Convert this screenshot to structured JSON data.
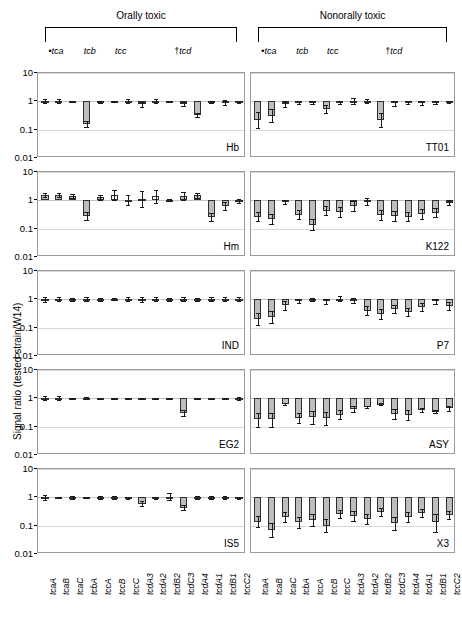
{
  "groups": {
    "left": {
      "title": "Orally toxic"
    },
    "right": {
      "title": "Nonorally toxic"
    }
  },
  "subheads": [
    {
      "marker": "•",
      "label": "tca"
    },
    {
      "marker": "",
      "label": "tcb"
    },
    {
      "marker": "",
      "label": "tcc"
    },
    {
      "marker": "†",
      "label": "tcd"
    }
  ],
  "axis": {
    "ylabel": "Signal ratio (tested strain/W14)",
    "yticks": [
      "10",
      "1",
      "0.1",
      "0.01"
    ],
    "ymin": 0.01,
    "ymax": 10,
    "baseline": 1
  },
  "genes": [
    "tcaA",
    "tcaB",
    "tcaC",
    "tcbA",
    "tccA",
    "tccB",
    "tccC",
    "tcdA3",
    "tcdA2",
    "tcdB2",
    "tcdC3",
    "tcdA4",
    "tcdA1",
    "tcdB1",
    "tccC2"
  ],
  "chart_data": {
    "type": "bar",
    "xlabel": "",
    "ylabel": "Signal ratio (tested strain/W14)",
    "yscale": "log",
    "ylim": [
      0.01,
      10
    ],
    "grid": true,
    "baseline": 1,
    "categories": [
      "tcaA",
      "tcaB",
      "tcaC",
      "tcbA",
      "tccA",
      "tccB",
      "tccC",
      "tcdA3",
      "tcdA2",
      "tcdB2",
      "tcdC3",
      "tcdA4",
      "tcdA1",
      "tcdB1",
      "tccC2"
    ],
    "column_groups": [
      "Orally toxic",
      "Nonorally toxic"
    ],
    "panels": [
      {
        "name": "Hb",
        "column": "left",
        "row": 0,
        "values": [
          1.05,
          1.02,
          0.98,
          0.16,
          0.95,
          0.99,
          1.0,
          0.78,
          1.03,
          0.98,
          0.8,
          0.33,
          0.95,
          0.92,
          0.97
        ],
        "err_low": [
          0.88,
          0.86,
          0.96,
          0.12,
          0.88,
          0.94,
          0.84,
          0.62,
          0.86,
          0.92,
          0.66,
          0.27,
          0.88,
          0.76,
          0.9
        ],
        "err_high": [
          1.25,
          1.2,
          1.0,
          0.21,
          1.02,
          1.04,
          1.18,
          0.95,
          1.22,
          1.04,
          0.96,
          0.4,
          1.02,
          1.1,
          1.04
        ],
        "open": [
          false,
          false,
          false,
          false,
          false,
          false,
          false,
          true,
          false,
          false,
          true,
          false,
          false,
          true,
          false
        ]
      },
      {
        "name": "Hm",
        "column": "left",
        "row": 1,
        "values": [
          1.55,
          1.5,
          1.45,
          0.28,
          1.3,
          1.6,
          1.05,
          1.15,
          1.4,
          1.02,
          1.45,
          1.5,
          0.25,
          0.62,
          0.95
        ],
        "err_low": [
          1.35,
          1.3,
          1.25,
          0.2,
          1.05,
          1.0,
          0.7,
          0.6,
          0.8,
          0.95,
          1.0,
          1.2,
          0.18,
          0.45,
          0.82
        ],
        "err_high": [
          1.8,
          1.75,
          1.65,
          0.4,
          1.6,
          2.4,
          1.5,
          2.1,
          2.3,
          1.1,
          2.0,
          1.85,
          0.35,
          0.86,
          1.1
        ],
        "open": [
          false,
          false,
          false,
          false,
          false,
          true,
          false,
          true,
          true,
          false,
          false,
          false,
          false,
          false,
          false
        ]
      },
      {
        "name": "IND",
        "column": "left",
        "row": 2,
        "values": [
          0.98,
          1.0,
          0.97,
          1.02,
          0.99,
          1.0,
          1.01,
          0.98,
          1.02,
          0.99,
          1.0,
          1.01,
          1.0,
          1.02,
          0.99
        ],
        "err_low": [
          0.8,
          0.84,
          0.86,
          0.88,
          0.9,
          0.92,
          0.86,
          0.8,
          0.88,
          0.86,
          0.84,
          0.9,
          0.86,
          0.88,
          0.86
        ],
        "err_high": [
          1.2,
          1.22,
          1.14,
          1.18,
          1.1,
          1.1,
          1.2,
          1.25,
          1.2,
          1.16,
          1.22,
          1.14,
          1.18,
          1.2,
          1.18
        ],
        "open": [
          false,
          false,
          false,
          false,
          false,
          false,
          false,
          false,
          true,
          false,
          true,
          true,
          false,
          true,
          false
        ]
      },
      {
        "name": "EG2",
        "column": "left",
        "row": 3,
        "values": [
          1.0,
          1.0,
          1.02,
          1.05,
          1.01,
          1.0,
          0.96,
          1.0,
          1.01,
          1.02,
          0.3,
          1.01,
          1.0,
          1.02,
          0.99
        ],
        "err_low": [
          0.84,
          0.84,
          0.98,
          0.96,
          0.98,
          0.96,
          0.92,
          0.96,
          0.98,
          0.98,
          0.24,
          0.98,
          0.96,
          0.98,
          0.88
        ],
        "err_high": [
          1.2,
          1.2,
          1.06,
          1.12,
          1.04,
          1.04,
          1.0,
          1.04,
          1.04,
          1.06,
          0.38,
          1.04,
          1.04,
          1.06,
          1.12
        ],
        "open": [
          false,
          false,
          false,
          false,
          false,
          false,
          false,
          false,
          false,
          false,
          false,
          false,
          false,
          false,
          false
        ]
      },
      {
        "name": "IS5",
        "column": "left",
        "row": 4,
        "values": [
          0.98,
          1.0,
          0.97,
          1.0,
          0.96,
          0.98,
          0.92,
          0.6,
          0.95,
          1.05,
          0.42,
          0.98,
          1.0,
          0.97,
          0.95
        ],
        "err_low": [
          0.8,
          0.96,
          0.86,
          0.96,
          0.86,
          0.88,
          0.84,
          0.48,
          0.86,
          0.78,
          0.35,
          0.88,
          0.88,
          0.88,
          0.86
        ],
        "err_high": [
          1.22,
          1.04,
          1.12,
          1.04,
          1.1,
          1.1,
          1.02,
          0.74,
          1.06,
          1.45,
          0.52,
          1.1,
          1.14,
          1.08,
          1.06
        ],
        "open": [
          false,
          false,
          false,
          false,
          false,
          false,
          false,
          false,
          false,
          false,
          false,
          false,
          false,
          false,
          false
        ]
      },
      {
        "name": "TT01",
        "column": "right",
        "row": 0,
        "values": [
          0.22,
          0.3,
          0.8,
          0.95,
          0.92,
          0.55,
          0.9,
          1.05,
          1.02,
          0.22,
          0.85,
          0.95,
          0.88,
          0.92,
          0.96
        ],
        "err_low": [
          0.11,
          0.18,
          0.62,
          0.82,
          0.8,
          0.4,
          0.78,
          0.82,
          0.84,
          0.12,
          0.7,
          0.82,
          0.72,
          0.8,
          0.84
        ],
        "err_high": [
          0.42,
          0.52,
          1.0,
          1.06,
          1.02,
          0.75,
          1.02,
          1.3,
          1.22,
          0.4,
          1.02,
          1.06,
          1.04,
          1.04,
          1.06
        ],
        "open": [
          false,
          false,
          true,
          false,
          false,
          false,
          false,
          false,
          false,
          false,
          false,
          false,
          false,
          true,
          false
        ]
      },
      {
        "name": "K122",
        "column": "right",
        "row": 1,
        "values": [
          0.26,
          0.22,
          0.85,
          0.3,
          0.14,
          0.42,
          0.38,
          0.62,
          0.9,
          0.3,
          0.28,
          0.26,
          0.32,
          0.36,
          0.82
        ],
        "err_low": [
          0.18,
          0.15,
          0.72,
          0.22,
          0.09,
          0.3,
          0.26,
          0.42,
          0.7,
          0.21,
          0.19,
          0.18,
          0.22,
          0.25,
          0.66
        ],
        "err_high": [
          0.4,
          0.34,
          1.0,
          0.44,
          0.22,
          0.62,
          0.56,
          0.95,
          1.25,
          0.45,
          0.42,
          0.39,
          0.48,
          0.54,
          1.02
        ],
        "open": [
          false,
          false,
          true,
          false,
          false,
          false,
          false,
          false,
          true,
          false,
          false,
          false,
          false,
          false,
          false
        ]
      },
      {
        "name": "P7",
        "column": "right",
        "row": 2,
        "values": [
          0.2,
          0.24,
          0.62,
          0.9,
          0.95,
          0.85,
          1.05,
          0.92,
          0.4,
          0.3,
          0.44,
          0.35,
          0.52,
          0.85,
          0.58
        ],
        "err_low": [
          0.12,
          0.15,
          0.42,
          0.74,
          0.84,
          0.7,
          0.84,
          0.76,
          0.28,
          0.21,
          0.32,
          0.25,
          0.38,
          0.7,
          0.42
        ],
        "err_high": [
          0.34,
          0.4,
          0.9,
          1.06,
          1.08,
          1.02,
          1.32,
          1.1,
          0.58,
          0.44,
          0.62,
          0.5,
          0.72,
          1.02,
          0.8
        ],
        "open": [
          false,
          false,
          false,
          false,
          true,
          false,
          true,
          true,
          false,
          false,
          false,
          false,
          false,
          true,
          false
        ]
      },
      {
        "name": "ASY",
        "column": "right",
        "row": 3,
        "values": [
          0.18,
          0.18,
          0.62,
          0.2,
          0.22,
          0.2,
          0.26,
          0.42,
          0.48,
          0.6,
          0.28,
          0.26,
          0.38,
          0.34,
          0.44
        ],
        "err_low": [
          0.1,
          0.1,
          0.58,
          0.13,
          0.12,
          0.11,
          0.18,
          0.34,
          0.44,
          0.56,
          0.18,
          0.17,
          0.32,
          0.3,
          0.36
        ],
        "err_high": [
          0.3,
          0.3,
          0.68,
          0.3,
          0.36,
          0.34,
          0.38,
          0.54,
          0.54,
          0.66,
          0.42,
          0.38,
          0.46,
          0.4,
          0.54
        ],
        "open": [
          false,
          false,
          false,
          false,
          false,
          false,
          false,
          false,
          false,
          false,
          false,
          false,
          false,
          false,
          false
        ]
      },
      {
        "name": "X3",
        "column": "right",
        "row": 4,
        "values": [
          0.14,
          0.07,
          0.2,
          0.13,
          0.16,
          0.1,
          0.26,
          0.22,
          0.17,
          0.3,
          0.12,
          0.2,
          0.28,
          0.13,
          0.24
        ],
        "err_low": [
          0.09,
          0.04,
          0.13,
          0.08,
          0.1,
          0.06,
          0.18,
          0.15,
          0.11,
          0.22,
          0.07,
          0.13,
          0.21,
          0.06,
          0.17
        ],
        "err_high": [
          0.22,
          0.12,
          0.3,
          0.2,
          0.26,
          0.17,
          0.37,
          0.33,
          0.26,
          0.41,
          0.2,
          0.3,
          0.38,
          0.26,
          0.34
        ],
        "open": [
          false,
          false,
          false,
          false,
          false,
          false,
          false,
          false,
          false,
          false,
          false,
          false,
          false,
          false,
          false
        ]
      }
    ]
  }
}
